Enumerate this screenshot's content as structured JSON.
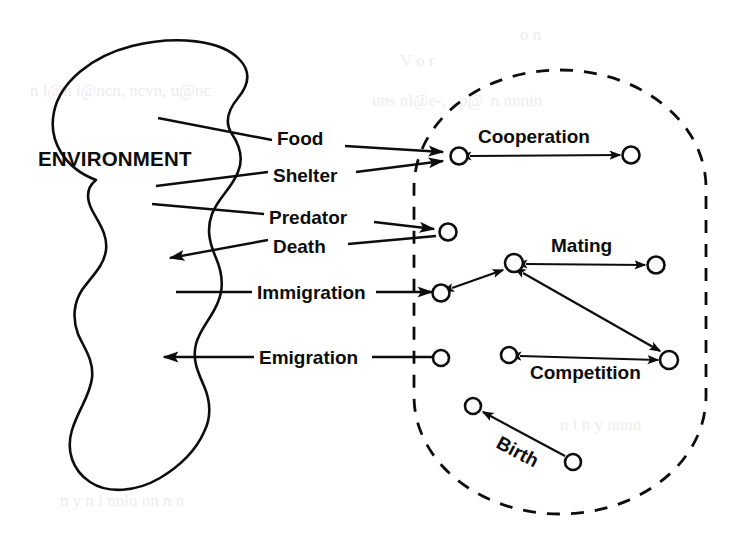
{
  "figure": {
    "type": "ecology-system-diagram",
    "environment_label": "ENVIRONMENT",
    "background_color": "#ffffff",
    "ink_color": "#0d0d0d"
  },
  "exchange_flows": [
    {
      "id": "food",
      "label": "Food",
      "direction": "environment-to-population"
    },
    {
      "id": "shelter",
      "label": "Shelter",
      "direction": "environment-to-population"
    },
    {
      "id": "predator",
      "label": "Predator",
      "direction": "environment-to-population"
    },
    {
      "id": "death",
      "label": "Death",
      "direction": "population-to-environment"
    },
    {
      "id": "immigration",
      "label": "Immigration",
      "direction": "environment-to-population"
    },
    {
      "id": "emigration",
      "label": "Emigration",
      "direction": "population-to-environment"
    }
  ],
  "interactions": [
    {
      "id": "cooperation",
      "label": "Cooperation",
      "arrow": "double"
    },
    {
      "id": "mating",
      "label": "Mating",
      "arrow": "double"
    },
    {
      "id": "competition",
      "label": "Competition",
      "arrow": "double"
    },
    {
      "id": "birth",
      "label": "Birth",
      "arrow": "single"
    }
  ],
  "population_nodes": [
    {
      "id": "n-cooperation-left",
      "cx": 459,
      "cy": 156
    },
    {
      "id": "n-cooperation-right",
      "cx": 631,
      "cy": 155
    },
    {
      "id": "n-predator",
      "cx": 448,
      "cy": 232
    },
    {
      "id": "n-mating-hub",
      "cx": 514,
      "cy": 263
    },
    {
      "id": "n-mating-right",
      "cx": 656,
      "cy": 265
    },
    {
      "id": "n-immigration",
      "cx": 441,
      "cy": 293
    },
    {
      "id": "n-emigration",
      "cx": 441,
      "cy": 358
    },
    {
      "id": "n-competition-left",
      "cx": 509,
      "cy": 355
    },
    {
      "id": "n-competition-right",
      "cx": 669,
      "cy": 360
    },
    {
      "id": "n-birth-target",
      "cx": 473,
      "cy": 406
    },
    {
      "id": "n-birth-source",
      "cx": 573,
      "cy": 462
    }
  ],
  "bleedthrough_text": [
    "of",
    "the",
    "and",
    "in",
    "a"
  ]
}
